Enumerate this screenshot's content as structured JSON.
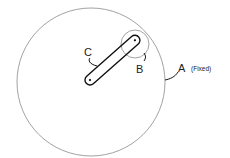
{
  "diagram": {
    "labels": {
      "a": "A",
      "a_note": "(Fixed)",
      "b": "B",
      "c": "C"
    },
    "colors": {
      "circle_stroke": "#8a8a8a",
      "link_stroke": "#111111"
    }
  }
}
